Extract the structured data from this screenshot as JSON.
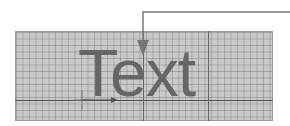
{
  "diagram": {
    "label": "Text",
    "colors": {
      "background": "#ffffff",
      "grid_fill": "#c9c9c9",
      "grid_line": "#8a8a8a",
      "major_line": "#555555",
      "text": "#666666",
      "callout": "#777777"
    },
    "elements": [
      {
        "type": "grid",
        "description": "fine graph-paper grid"
      },
      {
        "type": "text",
        "value": "Text"
      },
      {
        "type": "callout-arrow",
        "description": "leader line from top-right pointing down into the text"
      },
      {
        "type": "origin-marker",
        "description": "crosshair origin with horizontal arrow along baseline"
      }
    ]
  }
}
